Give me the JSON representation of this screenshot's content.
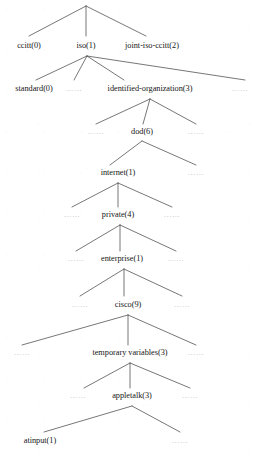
{
  "figure": {
    "type": "tree-diagram",
    "background_color": "#ffffff",
    "line_color": "#4a4a4a",
    "text_color": "#161616",
    "ellipsis_color": "#b9b9b9",
    "ellipsis_text": "……"
  },
  "nodes": [
    {
      "id": "root",
      "label": "",
      "x": 86,
      "y": 5,
      "apex": true
    },
    {
      "id": "ccitt",
      "label": "ccitt(0)",
      "x": 29,
      "y": 45
    },
    {
      "id": "iso",
      "label": "iso(1)",
      "x": 86,
      "y": 45
    },
    {
      "id": "joint",
      "label": "joint-iso-ccitt(2)",
      "x": 152,
      "y": 45
    },
    {
      "id": "standard",
      "label": "standard(0)",
      "x": 34,
      "y": 88
    },
    {
      "id": "identorg",
      "label": "identified-organization(3)",
      "x": 150,
      "y": 88
    },
    {
      "id": "dod",
      "label": "dod(6)",
      "x": 142,
      "y": 131
    },
    {
      "id": "internet",
      "label": "internet(1)",
      "x": 118,
      "y": 172
    },
    {
      "id": "private",
      "label": "private(4)",
      "x": 118,
      "y": 214
    },
    {
      "id": "enterprise",
      "label": "enterprise(1)",
      "x": 122,
      "y": 258
    },
    {
      "id": "cisco",
      "label": "cisco(9)",
      "x": 128,
      "y": 304
    },
    {
      "id": "tempvars",
      "label": "temporary variables(3)",
      "x": 130,
      "y": 352
    },
    {
      "id": "appletalk",
      "label": "appletalk(3)",
      "x": 132,
      "y": 395
    },
    {
      "id": "atinput",
      "label": "atinput(1)",
      "x": 40,
      "y": 440
    }
  ],
  "ellipses": [
    {
      "id": "e-standard-r",
      "x": 74,
      "y": 89
    },
    {
      "id": "e-identorg-r",
      "x": 240,
      "y": 89
    },
    {
      "id": "e-dod-l",
      "x": 96,
      "y": 132
    },
    {
      "id": "e-dod-r",
      "x": 196,
      "y": 132
    },
    {
      "id": "e-internet-r",
      "x": 196,
      "y": 173
    },
    {
      "id": "e-private-l",
      "x": 72,
      "y": 215
    },
    {
      "id": "e-private-r",
      "x": 172,
      "y": 215
    },
    {
      "id": "e-ent-l",
      "x": 76,
      "y": 259
    },
    {
      "id": "e-ent-r",
      "x": 176,
      "y": 259
    },
    {
      "id": "e-cisco-l",
      "x": 80,
      "y": 305
    },
    {
      "id": "e-cisco-r",
      "x": 182,
      "y": 305
    },
    {
      "id": "e-temp-l",
      "x": 22,
      "y": 353
    },
    {
      "id": "e-temp-r",
      "x": 196,
      "y": 353
    },
    {
      "id": "e-apple-l",
      "x": 78,
      "y": 396
    },
    {
      "id": "e-apple-r",
      "x": 190,
      "y": 396
    },
    {
      "id": "e-atinput-r",
      "x": 180,
      "y": 441
    }
  ],
  "edges": [
    {
      "from": "root-apex",
      "x1": 86,
      "y1": 6,
      "x2": 29,
      "y2": 36
    },
    {
      "from": "root-apex",
      "x1": 86,
      "y1": 6,
      "x2": 86,
      "y2": 36
    },
    {
      "from": "root-apex",
      "x1": 86,
      "y1": 6,
      "x2": 146,
      "y2": 36
    },
    {
      "from": "iso-apex",
      "x1": 87,
      "y1": 56,
      "x2": 36,
      "y2": 80
    },
    {
      "from": "iso-apex",
      "x1": 87,
      "y1": 56,
      "x2": 74,
      "y2": 80
    },
    {
      "from": "iso-apex",
      "x1": 87,
      "y1": 56,
      "x2": 124,
      "y2": 80
    },
    {
      "from": "iso-apex",
      "x1": 87,
      "y1": 56,
      "x2": 245,
      "y2": 80
    },
    {
      "from": "identorg-apex",
      "x1": 150,
      "y1": 99,
      "x2": 96,
      "y2": 124
    },
    {
      "from": "identorg-apex",
      "x1": 150,
      "y1": 99,
      "x2": 143,
      "y2": 124
    },
    {
      "from": "identorg-apex",
      "x1": 150,
      "y1": 99,
      "x2": 196,
      "y2": 124
    },
    {
      "from": "dod-apex",
      "x1": 142,
      "y1": 141,
      "x2": 110,
      "y2": 165
    },
    {
      "from": "dod-apex",
      "x1": 142,
      "y1": 141,
      "x2": 196,
      "y2": 165
    },
    {
      "from": "internet-apex",
      "x1": 118,
      "y1": 183,
      "x2": 72,
      "y2": 207
    },
    {
      "from": "internet-apex",
      "x1": 118,
      "y1": 183,
      "x2": 118,
      "y2": 207
    },
    {
      "from": "internet-apex",
      "x1": 118,
      "y1": 183,
      "x2": 172,
      "y2": 207
    },
    {
      "from": "private-apex",
      "x1": 120,
      "y1": 225,
      "x2": 76,
      "y2": 251
    },
    {
      "from": "private-apex",
      "x1": 120,
      "y1": 225,
      "x2": 120,
      "y2": 251
    },
    {
      "from": "private-apex",
      "x1": 120,
      "y1": 225,
      "x2": 176,
      "y2": 251
    },
    {
      "from": "ent-apex",
      "x1": 124,
      "y1": 269,
      "x2": 80,
      "y2": 296
    },
    {
      "from": "ent-apex",
      "x1": 124,
      "y1": 269,
      "x2": 124,
      "y2": 296
    },
    {
      "from": "ent-apex",
      "x1": 124,
      "y1": 269,
      "x2": 182,
      "y2": 296
    },
    {
      "from": "cisco-apex",
      "x1": 128,
      "y1": 315,
      "x2": 22,
      "y2": 345
    },
    {
      "from": "cisco-apex",
      "x1": 128,
      "y1": 315,
      "x2": 128,
      "y2": 345
    },
    {
      "from": "cisco-apex",
      "x1": 128,
      "y1": 315,
      "x2": 196,
      "y2": 345
    },
    {
      "from": "temp-apex",
      "x1": 130,
      "y1": 363,
      "x2": 84,
      "y2": 388
    },
    {
      "from": "temp-apex",
      "x1": 130,
      "y1": 363,
      "x2": 130,
      "y2": 388
    },
    {
      "from": "temp-apex",
      "x1": 130,
      "y1": 363,
      "x2": 190,
      "y2": 388
    },
    {
      "from": "apple-apex",
      "x1": 132,
      "y1": 406,
      "x2": 44,
      "y2": 432
    },
    {
      "from": "apple-apex",
      "x1": 132,
      "y1": 406,
      "x2": 180,
      "y2": 432
    }
  ]
}
